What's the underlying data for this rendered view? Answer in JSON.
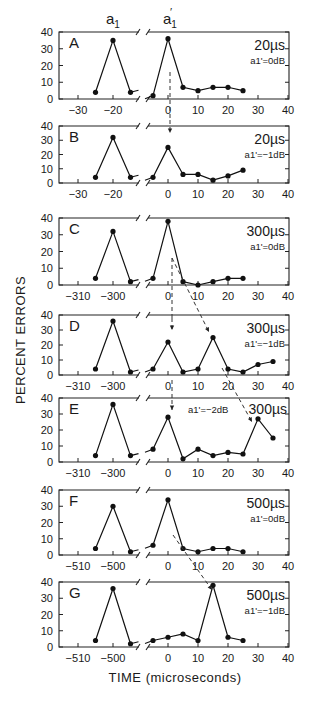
{
  "chart_data": {
    "type": "line",
    "ylabel": "PERCENT ERRORS",
    "xlabel": "TIME (microseconds)",
    "header_labels": [
      "a1",
      "a1'"
    ],
    "ylim": [
      0,
      40
    ],
    "yticks": [
      0,
      10,
      20,
      30,
      40
    ],
    "right_xticks": [
      0,
      10,
      20,
      30,
      40
    ],
    "panels": [
      {
        "letter": "A",
        "duration": "20µs",
        "level": "a1'=0dB",
        "left_ticks": [
          "-30",
          "-20"
        ],
        "left_center": -20,
        "left_points": [
          [
            -25,
            4
          ],
          [
            -20,
            35
          ],
          [
            -15,
            4
          ]
        ],
        "right_points": [
          [
            -5,
            2
          ],
          [
            0,
            36
          ],
          [
            5,
            7
          ],
          [
            10,
            5
          ],
          [
            15,
            7
          ],
          [
            20,
            7
          ],
          [
            25,
            5
          ]
        ]
      },
      {
        "letter": "B",
        "duration": "20µs",
        "level": "a1'=-1dB",
        "left_ticks": [
          "-30",
          "-20"
        ],
        "left_center": -20,
        "left_points": [
          [
            -25,
            4
          ],
          [
            -20,
            32
          ],
          [
            -15,
            4
          ]
        ],
        "right_points": [
          [
            -5,
            4
          ],
          [
            0,
            25
          ],
          [
            5,
            6
          ],
          [
            10,
            6
          ],
          [
            15,
            2
          ],
          [
            20,
            5
          ],
          [
            25,
            9
          ]
        ]
      },
      {
        "letter": "C",
        "duration": "300µs",
        "level": "a1'=0dB",
        "left_ticks": [
          "-310",
          "-300"
        ],
        "left_center": -300,
        "left_points": [
          [
            -305,
            4
          ],
          [
            -300,
            32
          ],
          [
            -295,
            2
          ]
        ],
        "right_points": [
          [
            -5,
            4
          ],
          [
            0,
            38
          ],
          [
            5,
            2
          ],
          [
            10,
            0
          ],
          [
            15,
            2
          ],
          [
            20,
            4
          ],
          [
            25,
            4
          ]
        ]
      },
      {
        "letter": "D",
        "duration": "300µs",
        "level": "a1'=-1dB",
        "left_ticks": [
          "-310",
          "-300"
        ],
        "left_center": -300,
        "left_points": [
          [
            -305,
            4
          ],
          [
            -300,
            36
          ],
          [
            -295,
            2
          ]
        ],
        "right_points": [
          [
            -5,
            4
          ],
          [
            0,
            22
          ],
          [
            5,
            2
          ],
          [
            10,
            4
          ],
          [
            15,
            25
          ],
          [
            20,
            4
          ],
          [
            25,
            2
          ],
          [
            30,
            7
          ],
          [
            35,
            9
          ]
        ]
      },
      {
        "letter": "E",
        "duration": "300µs",
        "level": "a1'=-2dB",
        "left_ticks": [
          "-310",
          "-300"
        ],
        "left_center": -300,
        "left_points": [
          [
            -305,
            4
          ],
          [
            -300,
            36
          ],
          [
            -295,
            4
          ]
        ],
        "right_points": [
          [
            -5,
            8
          ],
          [
            0,
            28
          ],
          [
            5,
            2
          ],
          [
            10,
            8
          ],
          [
            15,
            4
          ],
          [
            20,
            6
          ],
          [
            25,
            5
          ],
          [
            30,
            27
          ],
          [
            35,
            15
          ]
        ]
      },
      {
        "letter": "F",
        "duration": "500µs",
        "level": "a1'=0dB",
        "left_ticks": [
          "-510",
          "-500"
        ],
        "left_center": -500,
        "left_points": [
          [
            -505,
            4
          ],
          [
            -500,
            30
          ],
          [
            -495,
            2
          ]
        ],
        "right_points": [
          [
            -5,
            6
          ],
          [
            0,
            34
          ],
          [
            5,
            4
          ],
          [
            10,
            2
          ],
          [
            15,
            4
          ],
          [
            20,
            4
          ],
          [
            25,
            2
          ]
        ]
      },
      {
        "letter": "G",
        "duration": "500µs",
        "level": "a1'=-1dB",
        "left_ticks": [
          "-510",
          "-500"
        ],
        "left_center": -500,
        "left_points": [
          [
            -505,
            4
          ],
          [
            -500,
            36
          ],
          [
            -495,
            2
          ]
        ],
        "right_points": [
          [
            -5,
            4
          ],
          [
            0,
            6
          ],
          [
            5,
            8
          ],
          [
            10,
            4
          ],
          [
            15,
            38
          ],
          [
            20,
            6
          ],
          [
            25,
            4
          ]
        ]
      }
    ]
  },
  "labels": {
    "ylabel": "PERCENT ERRORS",
    "xlabel": "TIME (microseconds)",
    "a1": "a",
    "a1_sub": "1",
    "a1p": "a",
    "a1p_sub": "1",
    "a1p_prime": "′"
  }
}
